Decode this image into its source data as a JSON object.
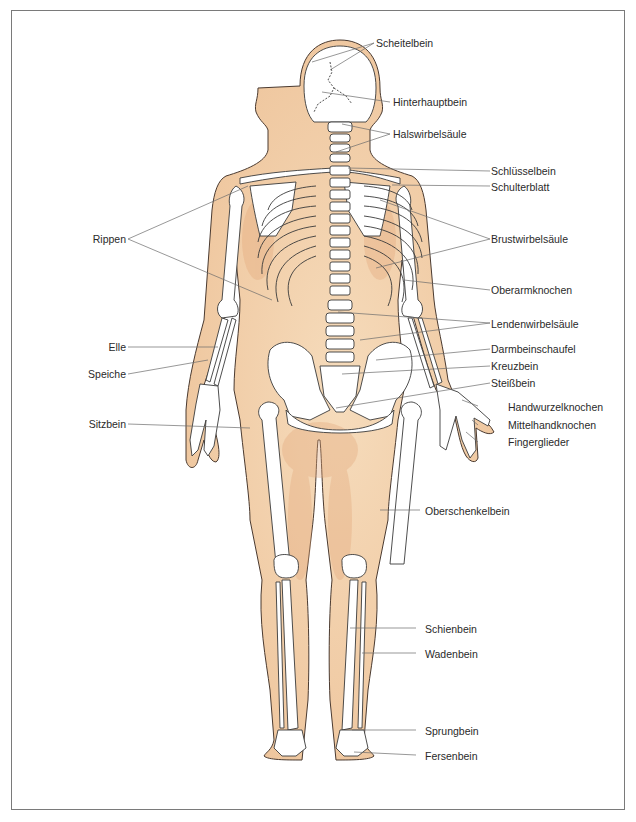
{
  "diagram": {
    "type": "anatomical-illustration",
    "colors": {
      "skin": "#f2d2ad",
      "skin_shadow": "#e3ad80",
      "bone": "#ffffff",
      "outline": "#3a3a3a",
      "leader_line": "#6b6b6b",
      "frame": "#7a7a7a"
    },
    "labels_right": [
      {
        "id": "scheitelbein",
        "text": "Scheitelbein"
      },
      {
        "id": "hinterhauptbein",
        "text": "Hinterhauptbein"
      },
      {
        "id": "halswirbelsaeule",
        "text": "Halswirbelsäule"
      },
      {
        "id": "schluesselbein",
        "text": "Schlüsselbein"
      },
      {
        "id": "schulterblatt",
        "text": "Schulterblatt"
      },
      {
        "id": "brustwirbelsaeule",
        "text": "Brustwirbelsäule"
      },
      {
        "id": "oberarmknochen",
        "text": "Oberarmknochen"
      },
      {
        "id": "lendenwirbelsaeule",
        "text": "Lendenwirbelsäule"
      },
      {
        "id": "darmbeinschaufel",
        "text": "Darmbeinschaufel"
      },
      {
        "id": "kreuzbein",
        "text": "Kreuzbein"
      },
      {
        "id": "steissbein",
        "text": "Steißbein"
      },
      {
        "id": "handwurzelknochen",
        "text": "Handwurzelknochen"
      },
      {
        "id": "mittelhandknochen",
        "text": "Mittelhandknochen"
      },
      {
        "id": "fingerglieder",
        "text": "Fingerglieder"
      },
      {
        "id": "oberschenkelbein",
        "text": "Oberschenkelbein"
      },
      {
        "id": "schienbein",
        "text": "Schienbein"
      },
      {
        "id": "wadenbein",
        "text": "Wadenbein"
      },
      {
        "id": "sprungbein",
        "text": "Sprungbein"
      },
      {
        "id": "fersenbein",
        "text": "Fersenbein"
      }
    ],
    "labels_left": [
      {
        "id": "rippen",
        "text": "Rippen"
      },
      {
        "id": "elle",
        "text": "Elle"
      },
      {
        "id": "speiche",
        "text": "Speiche"
      },
      {
        "id": "sitzbein",
        "text": "Sitzbein"
      }
    ]
  }
}
